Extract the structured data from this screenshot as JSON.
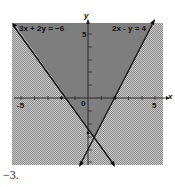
{
  "figure": {
    "problem_number": "−3.",
    "axes": {
      "x_label": "x",
      "y_label": "y",
      "x_tick_neg": "-5",
      "x_tick_origin": "0",
      "x_tick_pos": "5",
      "y_tick_pos": "5"
    },
    "lines": [
      {
        "equation": "3x + 2y = -6",
        "label": "3x + 2y = −6"
      },
      {
        "equation": "2x - y = 4",
        "label": "2x - y = 4"
      }
    ],
    "colors": {
      "dark_shade": "#7a7a7a",
      "light_shade": "#b8b8b8",
      "line": "#111111"
    }
  }
}
